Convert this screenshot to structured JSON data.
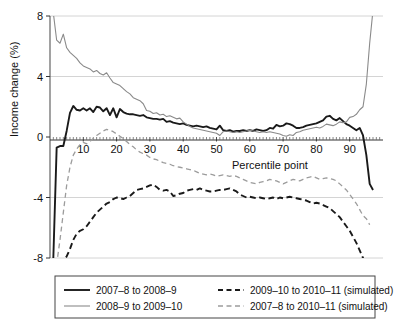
{
  "chart_data": {
    "type": "line",
    "title": "",
    "xlabel": "Percentile point",
    "ylabel": "Income change (%)",
    "xlim": [
      0,
      100
    ],
    "ylim": [
      -8,
      8
    ],
    "xticks": [
      10,
      20,
      30,
      40,
      50,
      60,
      70,
      80,
      90
    ],
    "yticks": [
      -8,
      -4,
      0,
      4,
      8
    ],
    "grid": "horizontal",
    "legend_position": "below-plot",
    "series": [
      {
        "name": "2007–8 to 2008–9",
        "style": "solid",
        "color": "#1a1a1a",
        "width": 1.9,
        "x": [
          1,
          2,
          3,
          4,
          5,
          6,
          7,
          8,
          9,
          10,
          11,
          12,
          13,
          14,
          15,
          16,
          17,
          18,
          19,
          20,
          21,
          22,
          23,
          24,
          25,
          26,
          27,
          28,
          29,
          30,
          31,
          32,
          33,
          34,
          35,
          36,
          37,
          38,
          39,
          40,
          41,
          42,
          43,
          44,
          45,
          46,
          47,
          48,
          49,
          50,
          51,
          52,
          53,
          54,
          55,
          56,
          57,
          58,
          59,
          60,
          61,
          62,
          63,
          64,
          65,
          66,
          67,
          68,
          69,
          70,
          71,
          72,
          73,
          74,
          75,
          76,
          77,
          78,
          79,
          80,
          81,
          82,
          83,
          84,
          85,
          86,
          87,
          88,
          89,
          90,
          91,
          92,
          93,
          94,
          95,
          96,
          97
        ],
        "y": [
          -8.0,
          -0.7,
          -0.6,
          -0.6,
          0.4,
          1.6,
          2.05,
          1.8,
          1.75,
          1.9,
          1.75,
          1.9,
          1.65,
          2.0,
          1.95,
          1.7,
          1.9,
          1.45,
          1.9,
          1.3,
          1.85,
          1.65,
          1.55,
          1.5,
          1.5,
          1.45,
          1.4,
          1.45,
          1.3,
          1.25,
          1.2,
          1.2,
          1.15,
          1.2,
          1.0,
          1.05,
          0.95,
          0.9,
          0.85,
          0.9,
          0.8,
          0.75,
          0.7,
          0.75,
          0.7,
          0.65,
          0.7,
          0.6,
          0.55,
          0.5,
          0.75,
          0.45,
          0.4,
          0.45,
          0.35,
          0.4,
          0.4,
          0.45,
          0.4,
          0.45,
          0.4,
          0.5,
          0.45,
          0.4,
          0.45,
          0.6,
          0.55,
          0.8,
          0.7,
          0.75,
          0.9,
          0.85,
          0.75,
          0.6,
          0.6,
          0.65,
          0.75,
          0.8,
          0.85,
          0.9,
          1.0,
          1.1,
          1.35,
          1.4,
          1.2,
          1.1,
          1.25,
          1.05,
          0.85,
          0.75,
          0.6,
          0.45,
          0.6,
          0.1,
          -1.2,
          -3.1,
          -3.5
        ]
      },
      {
        "name": "2008–9 to 2009–10",
        "style": "solid",
        "color": "#8a8a8a",
        "width": 1.1,
        "x": [
          1,
          2,
          3,
          4,
          5,
          6,
          7,
          8,
          9,
          10,
          11,
          12,
          13,
          14,
          15,
          16,
          17,
          18,
          19,
          20,
          21,
          22,
          23,
          24,
          25,
          26,
          27,
          28,
          29,
          30,
          31,
          32,
          33,
          34,
          35,
          36,
          37,
          38,
          39,
          40,
          41,
          42,
          43,
          44,
          45,
          46,
          47,
          48,
          49,
          50,
          51,
          52,
          53,
          54,
          55,
          56,
          57,
          58,
          59,
          60,
          61,
          62,
          63,
          64,
          65,
          66,
          67,
          68,
          69,
          70,
          71,
          72,
          73,
          74,
          75,
          76,
          77,
          78,
          79,
          80,
          81,
          82,
          83,
          84,
          85,
          86,
          87,
          88,
          89,
          90,
          91,
          92,
          93,
          94,
          95,
          96,
          97
        ],
        "y": [
          8.2,
          6.4,
          6.2,
          6.8,
          5.9,
          5.6,
          5.4,
          5.2,
          4.9,
          4.7,
          4.6,
          4.5,
          4.3,
          4.4,
          4.2,
          4.1,
          4.25,
          3.9,
          3.6,
          3.5,
          3.4,
          3.2,
          3.0,
          2.85,
          2.6,
          2.5,
          2.4,
          2.2,
          1.75,
          1.7,
          1.55,
          1.6,
          1.45,
          1.5,
          1.35,
          1.4,
          1.3,
          1.2,
          1.25,
          1.0,
          0.85,
          0.7,
          0.6,
          0.55,
          0.5,
          0.45,
          0.4,
          0.35,
          0.3,
          0.25,
          0.1,
          0.35,
          0.4,
          0.35,
          0.3,
          0.35,
          0.3,
          0.35,
          0.4,
          0.45,
          0.4,
          0.35,
          0.3,
          0.35,
          0.3,
          0.35,
          0.3,
          0.25,
          0.2,
          0.1,
          0.05,
          0.15,
          0.1,
          0.3,
          0.35,
          0.45,
          0.5,
          0.55,
          0.6,
          0.65,
          0.6,
          0.7,
          0.85,
          0.8,
          0.75,
          0.85,
          1.0,
          0.95,
          1.0,
          1.3,
          1.35,
          1.5,
          1.8,
          2.0,
          3.5,
          6.2,
          8.4
        ]
      },
      {
        "name": "2009–10 to 2010–11 (simulated)",
        "style": "dashed",
        "color": "#1a1a1a",
        "width": 1.9,
        "x": [
          1,
          2,
          3,
          4,
          5,
          6,
          7,
          8,
          9,
          10,
          11,
          12,
          13,
          14,
          15,
          16,
          17,
          18,
          19,
          20,
          21,
          22,
          23,
          24,
          25,
          26,
          27,
          28,
          29,
          30,
          31,
          32,
          33,
          34,
          35,
          36,
          37,
          38,
          39,
          40,
          41,
          42,
          43,
          44,
          45,
          46,
          47,
          48,
          49,
          50,
          51,
          52,
          53,
          54,
          55,
          56,
          57,
          58,
          59,
          60,
          61,
          62,
          63,
          64,
          65,
          66,
          67,
          68,
          69,
          70,
          71,
          72,
          73,
          74,
          75,
          76,
          77,
          78,
          79,
          80,
          81,
          82,
          83,
          84,
          85,
          86,
          87,
          88,
          89,
          90,
          91,
          92,
          93,
          94,
          95,
          96
        ],
        "y": [
          -9.5,
          -8.4,
          -8.2,
          -8.1,
          -7.9,
          -7.4,
          -6.8,
          -6.4,
          -6.2,
          -6.1,
          -5.9,
          -5.6,
          -5.3,
          -5.0,
          -4.8,
          -4.6,
          -4.4,
          -4.3,
          -4.1,
          -4.0,
          -4.05,
          -4.1,
          -4.0,
          -3.9,
          -3.7,
          -3.5,
          -3.45,
          -3.4,
          -3.3,
          -3.2,
          -3.15,
          -3.3,
          -3.5,
          -3.55,
          -3.5,
          -3.6,
          -3.9,
          -3.85,
          -3.75,
          -3.7,
          -3.55,
          -3.5,
          -3.45,
          -3.5,
          -3.4,
          -3.5,
          -3.55,
          -3.6,
          -3.6,
          -3.55,
          -3.5,
          -3.5,
          -3.45,
          -3.4,
          -3.5,
          -3.6,
          -3.8,
          -3.9,
          -4.0,
          -3.95,
          -4.0,
          -4.05,
          -4.0,
          -4.05,
          -4.1,
          -4.05,
          -4.0,
          -4.1,
          -4.0,
          -4.05,
          -4.0,
          -3.95,
          -4.0,
          -4.05,
          -4.1,
          -4.15,
          -4.2,
          -4.3,
          -4.4,
          -4.35,
          -4.4,
          -4.5,
          -4.6,
          -4.7,
          -4.9,
          -5.1,
          -5.3,
          -5.6,
          -5.9,
          -6.2,
          -6.6,
          -7.0,
          -7.5,
          -8.0,
          -8.6,
          -9.2
        ]
      },
      {
        "name": "2007–8 to 2010–11 (simulated)",
        "style": "dashed",
        "color": "#9c9c9c",
        "width": 1.3,
        "x": [
          1,
          2,
          3,
          4,
          5,
          6,
          7,
          8,
          9,
          10,
          11,
          12,
          13,
          14,
          15,
          16,
          17,
          18,
          19,
          20,
          21,
          22,
          23,
          24,
          25,
          26,
          27,
          28,
          29,
          30,
          31,
          32,
          33,
          34,
          35,
          36,
          37,
          38,
          39,
          40,
          41,
          42,
          43,
          44,
          45,
          46,
          47,
          48,
          49,
          50,
          51,
          52,
          53,
          54,
          55,
          56,
          57,
          58,
          59,
          60,
          61,
          62,
          63,
          64,
          65,
          66,
          67,
          68,
          69,
          70,
          71,
          72,
          73,
          74,
          75,
          76,
          77,
          78,
          79,
          80,
          81,
          82,
          83,
          84,
          85,
          86,
          87,
          88,
          89,
          90,
          91,
          92,
          93,
          94,
          95,
          96
        ],
        "y": [
          -9.0,
          -8.4,
          -6.8,
          -5.0,
          -3.2,
          -2.0,
          -1.2,
          -0.8,
          -0.5,
          -0.35,
          -0.45,
          -0.3,
          -0.1,
          0.1,
          0.25,
          0.4,
          0.5,
          0.45,
          0.35,
          0.2,
          0.05,
          -0.1,
          -0.3,
          -0.5,
          -0.65,
          -0.85,
          -1.0,
          -1.1,
          -1.2,
          -1.35,
          -1.45,
          -1.5,
          -1.6,
          -1.7,
          -1.75,
          -1.8,
          -1.9,
          -1.95,
          -2.0,
          -2.05,
          -2.1,
          -2.15,
          -2.2,
          -2.3,
          -2.4,
          -2.45,
          -2.5,
          -2.45,
          -2.5,
          -2.6,
          -2.55,
          -2.5,
          -2.55,
          -2.6,
          -2.55,
          -2.6,
          -2.7,
          -2.8,
          -2.9,
          -3.0,
          -3.05,
          -3.1,
          -3.0,
          -2.95,
          -2.9,
          -2.8,
          -2.85,
          -2.9,
          -3.0,
          -3.1,
          -3.0,
          -2.9,
          -2.8,
          -2.85,
          -2.9,
          -2.8,
          -2.7,
          -2.65,
          -2.6,
          -2.7,
          -2.8,
          -2.75,
          -2.7,
          -2.75,
          -2.8,
          -2.9,
          -3.1,
          -3.3,
          -3.5,
          -3.8,
          -4.1,
          -4.4,
          -4.8,
          -5.2,
          -5.4,
          -5.8
        ]
      }
    ]
  },
  "legend": {
    "entries": [
      {
        "label": "2007–8 to 2008–9",
        "style": "solid",
        "color": "#1a1a1a"
      },
      {
        "label": "2009–10 to 2010–11 (simulated)",
        "style": "dashed",
        "color": "#1a1a1a"
      },
      {
        "label": "2008–9 to 2009–10",
        "style": "solid",
        "color": "#8a8a8a"
      },
      {
        "label": "2007–8 to 2010–11 (simulated)",
        "style": "dashed",
        "color": "#9c9c9c"
      }
    ]
  },
  "axes": {
    "y_label": "Income change (%)",
    "x_label": "Percentile point",
    "y_tick_labels": [
      "8",
      "4",
      "0",
      "-4",
      "-8"
    ],
    "x_tick_labels": [
      "10",
      "20",
      "30",
      "40",
      "50",
      "60",
      "70",
      "80",
      "90"
    ]
  }
}
